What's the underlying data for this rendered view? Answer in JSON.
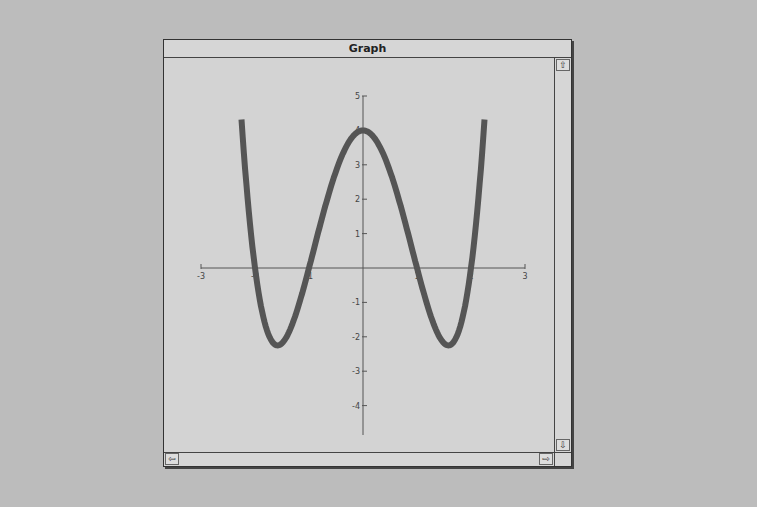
{
  "window": {
    "title": "Graph",
    "scroll_up_icon": "⇧",
    "scroll_down_icon": "⇩",
    "scroll_left_icon": "⇦",
    "scroll_right_icon": "⇨"
  },
  "chart_data": {
    "type": "line",
    "title": "Graph",
    "function": "f(x) = x^4 - 5x^2 + 4",
    "xlabel": "",
    "ylabel": "",
    "xlim": [
      -3,
      3
    ],
    "ylim": [
      -5,
      5
    ],
    "x_ticks": [
      -3,
      -2,
      -1,
      1,
      2,
      3
    ],
    "y_ticks": [
      5,
      4,
      3,
      2,
      1,
      -1,
      -2,
      -3,
      -4,
      -5
    ],
    "grid": false,
    "legend": null,
    "series": [
      {
        "name": "f(x)",
        "color": "#555555",
        "x": [
          -2.25,
          -2,
          -1.75,
          -1.58,
          -1.5,
          -1.25,
          -1,
          -0.75,
          -0.5,
          -0.25,
          0,
          0.25,
          0.5,
          0.75,
          1,
          1.25,
          1.5,
          1.58,
          1.75,
          2,
          2.25
        ],
        "y": [
          4.32,
          0,
          -1.94,
          -2.25,
          -2.19,
          -1.37,
          0,
          1.5,
          2.81,
          3.69,
          4,
          3.69,
          2.81,
          1.5,
          0,
          -1.37,
          -2.19,
          -2.25,
          -1.94,
          0,
          4.32
        ]
      }
    ],
    "roots": [
      -2,
      -1,
      1,
      2
    ],
    "local_max": {
      "x": 0,
      "y": 4
    },
    "local_mins": [
      {
        "x": -1.58,
        "y": -2.25
      },
      {
        "x": 1.58,
        "y": -2.25
      }
    ]
  }
}
